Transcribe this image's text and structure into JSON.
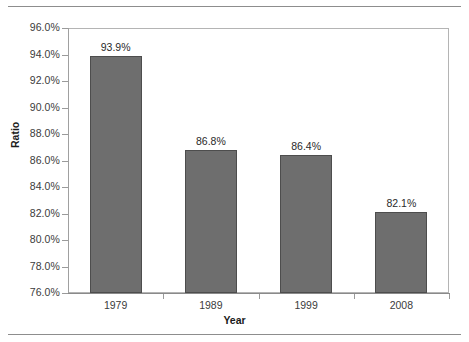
{
  "chart_data": {
    "type": "bar",
    "title": "",
    "subtitle": "",
    "xlabel": "Year",
    "ylabel": "Ratio",
    "categories": [
      "1979",
      "1989",
      "1999",
      "2008"
    ],
    "values": [
      93.9,
      86.8,
      86.4,
      82.1
    ],
    "data_labels": [
      "93.9%",
      "86.8%",
      "86.4%",
      "82.1%"
    ],
    "series": [
      {
        "name": "Ratio",
        "values": [
          93.9,
          86.8,
          86.4,
          82.1
        ]
      }
    ],
    "ylim": [
      76.0,
      96.0
    ],
    "ytick_values": [
      76.0,
      78.0,
      80.0,
      82.0,
      84.0,
      86.0,
      88.0,
      90.0,
      92.0,
      94.0,
      96.0
    ],
    "ytick_labels": [
      "76.0%",
      "78.0%",
      "80.0%",
      "82.0%",
      "84.0%",
      "86.0%",
      "88.0%",
      "90.0%",
      "92.0%",
      "94.0%",
      "96.0%"
    ],
    "grid": false,
    "legend": false,
    "legend_position": "none",
    "bar_color": "#6e6e6e",
    "bar_edge_color": "#4d4d4d",
    "axis_color": "#b4b4b4",
    "text_color": "#3b3b3b"
  }
}
